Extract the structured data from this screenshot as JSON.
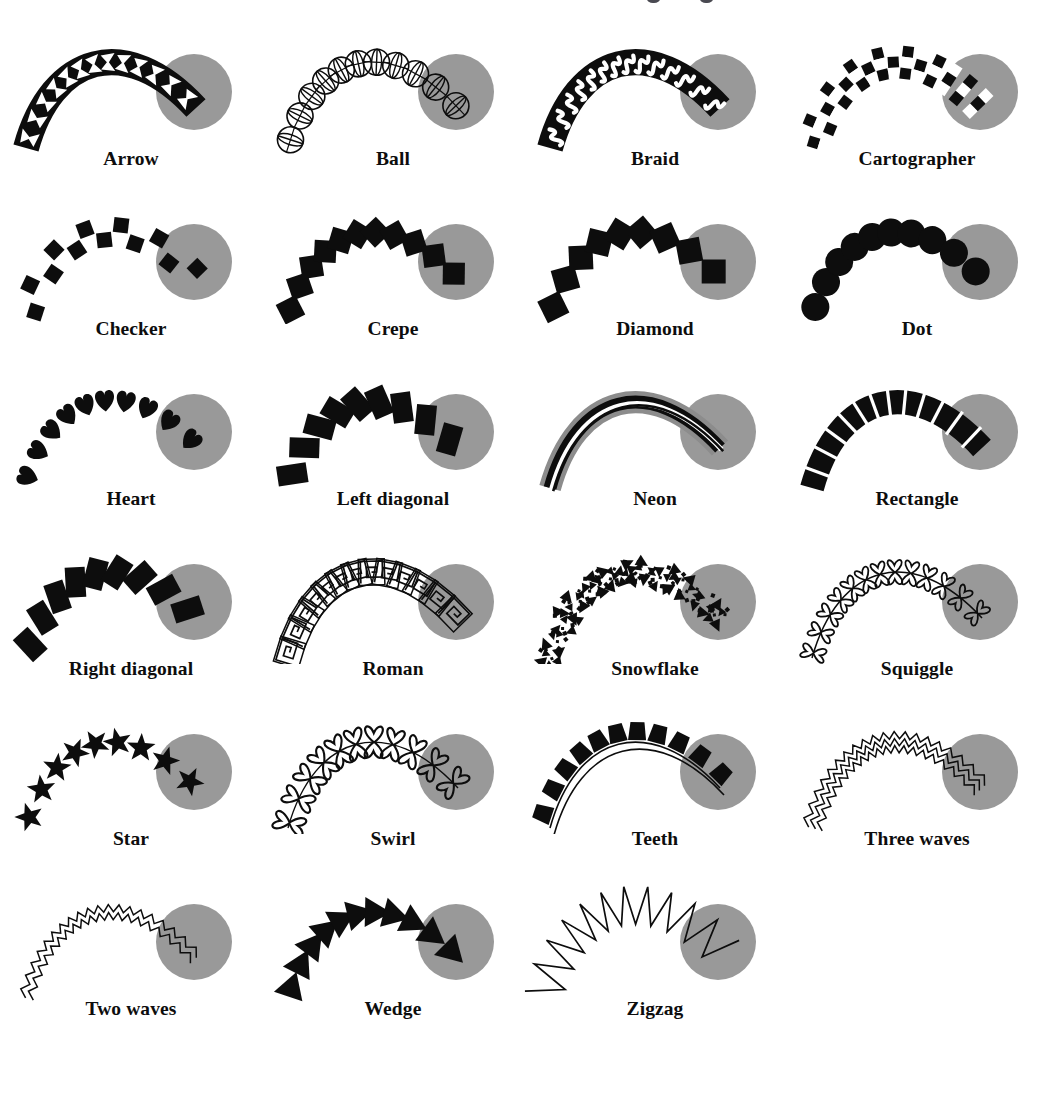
{
  "figure": {
    "kind": "brush-style-specimen-grid",
    "columns": 4,
    "rows": 6,
    "total_items": 23
  },
  "colors": {
    "ink": "#0d0d0d",
    "paper": "#ffffff",
    "circle_gray": "#999999",
    "neon_glow_gray": "#8c8c8c",
    "caption_text": "#0d0d0d"
  },
  "top_cropped_marks": [
    {
      "x": 647
    },
    {
      "x": 700
    }
  ],
  "items": [
    {
      "id": "arrow",
      "label": "Arrow",
      "style": "arrow",
      "row": 1,
      "col": 1
    },
    {
      "id": "ball",
      "label": "Ball",
      "style": "ball",
      "row": 1,
      "col": 2
    },
    {
      "id": "braid",
      "label": "Braid",
      "style": "braid",
      "row": 1,
      "col": 3
    },
    {
      "id": "cartographer",
      "label": "Cartographer",
      "style": "cartographer",
      "row": 1,
      "col": 4
    },
    {
      "id": "checker",
      "label": "Checker",
      "style": "checker",
      "row": 2,
      "col": 1
    },
    {
      "id": "crepe",
      "label": "Crepe",
      "style": "crepe",
      "row": 2,
      "col": 2
    },
    {
      "id": "diamond",
      "label": "Diamond",
      "style": "diamond",
      "row": 2,
      "col": 3
    },
    {
      "id": "dot",
      "label": "Dot",
      "style": "dot",
      "row": 2,
      "col": 4
    },
    {
      "id": "heart",
      "label": "Heart",
      "style": "heart",
      "row": 3,
      "col": 1
    },
    {
      "id": "left-diagonal",
      "label": "Left diagonal",
      "style": "leftdiag",
      "row": 3,
      "col": 2
    },
    {
      "id": "neon",
      "label": "Neon",
      "style": "neon",
      "row": 3,
      "col": 3
    },
    {
      "id": "rectangle",
      "label": "Rectangle",
      "style": "rectangle",
      "row": 3,
      "col": 4
    },
    {
      "id": "right-diagonal",
      "label": "Right diagonal",
      "style": "rightdiag",
      "row": 4,
      "col": 1
    },
    {
      "id": "roman",
      "label": "Roman",
      "style": "roman",
      "row": 4,
      "col": 2
    },
    {
      "id": "snowflake",
      "label": "Snowflake",
      "style": "snowflake",
      "row": 4,
      "col": 3
    },
    {
      "id": "squiggle",
      "label": "Squiggle",
      "style": "squiggle",
      "row": 4,
      "col": 4
    },
    {
      "id": "star",
      "label": "Star",
      "style": "star",
      "row": 5,
      "col": 1
    },
    {
      "id": "swirl",
      "label": "Swirl",
      "style": "swirl",
      "row": 5,
      "col": 2
    },
    {
      "id": "teeth",
      "label": "Teeth",
      "style": "teeth",
      "row": 5,
      "col": 3
    },
    {
      "id": "three-waves",
      "label": "Three waves",
      "style": "threewaves",
      "row": 5,
      "col": 4
    },
    {
      "id": "two-waves",
      "label": "Two waves",
      "style": "twowaves",
      "row": 6,
      "col": 1
    },
    {
      "id": "wedge",
      "label": "Wedge",
      "style": "wedge",
      "row": 6,
      "col": 2
    },
    {
      "id": "zigzag",
      "label": "Zigzag",
      "style": "zigzag",
      "row": 6,
      "col": 3
    }
  ]
}
